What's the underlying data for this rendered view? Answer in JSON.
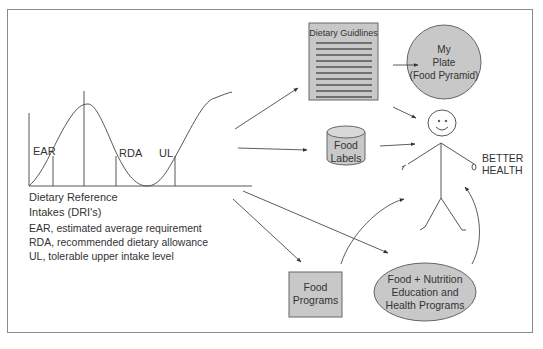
{
  "diagram": {
    "dri_curve": {
      "labels": {
        "ear": "EAR",
        "rda": "RDA",
        "ul": "UL"
      }
    },
    "dri_legend": {
      "title_line1": "Dietary Reference",
      "title_line2": "Intakes (DRI's)",
      "items": [
        "EAR, estimated average requirement",
        "RDA, recommended dietary allowance",
        "UL, tolerable upper intake level"
      ]
    },
    "nodes": {
      "dietary_guidelines": "Dietary Guidlines",
      "my_plate": {
        "line1": "My",
        "line2": "Plate",
        "line3": "(Food Pyramid)"
      },
      "food_labels": {
        "line1": "Food",
        "line2": "Labels"
      },
      "better_health": {
        "line1": "BETTER",
        "line2": "HEALTH"
      },
      "food_programs": {
        "line1": "Food",
        "line2": "Programs"
      },
      "education_programs": {
        "line1": "Food + Nutrition",
        "line2": "Education and",
        "line3": "Health Programs"
      }
    },
    "colors": {
      "shape_fill": "#c8c8c8",
      "stroke": "#555555",
      "border": "#8a8a8a"
    }
  }
}
